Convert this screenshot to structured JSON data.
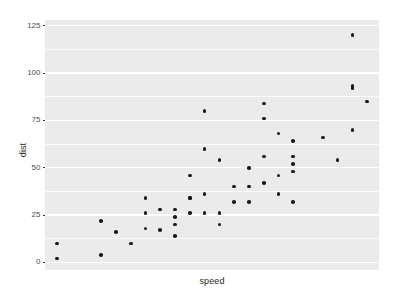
{
  "chart_data": {
    "type": "scatter",
    "title": "",
    "subtitle": "",
    "xlabel": "speed",
    "ylabel": "dist",
    "xlim": [
      3.2,
      25.8
    ],
    "ylim": [
      -4,
      128
    ],
    "xticks": [],
    "xticklabels": [],
    "yticks": [
      0,
      25,
      50,
      75,
      100,
      125
    ],
    "yticklabels": [
      "0",
      "25",
      "50",
      "75",
      "100",
      "125"
    ],
    "y_minor_ticks": [
      12.5,
      37.5,
      62.5,
      87.5,
      112.5
    ],
    "grid": "horizontal-white-on-gray",
    "legend": "none",
    "point_color": "#1a1a1a",
    "panel_background": "#ebebeb",
    "grid_color": "#ffffff",
    "plot_background": "#ffffff",
    "n_points": 50,
    "x": [
      4,
      4,
      7,
      7,
      8,
      9,
      10,
      10,
      10,
      11,
      11,
      12,
      12,
      12,
      12,
      13,
      13,
      13,
      13,
      14,
      14,
      14,
      14,
      15,
      15,
      15,
      16,
      16,
      17,
      17,
      17,
      18,
      18,
      18,
      18,
      19,
      19,
      19,
      20,
      20,
      20,
      20,
      20,
      22,
      23,
      24,
      24,
      24,
      24,
      25
    ],
    "y": [
      2,
      10,
      4,
      22,
      16,
      10,
      18,
      26,
      34,
      17,
      28,
      14,
      20,
      24,
      28,
      26,
      34,
      34,
      46,
      26,
      36,
      60,
      80,
      20,
      26,
      54,
      32,
      40,
      32,
      40,
      50,
      42,
      56,
      76,
      84,
      36,
      46,
      68,
      32,
      48,
      52,
      56,
      64,
      66,
      54,
      70,
      92,
      93,
      120,
      85
    ],
    "points": [
      {
        "x": 4,
        "y": 2
      },
      {
        "x": 4,
        "y": 10
      },
      {
        "x": 7,
        "y": 4
      },
      {
        "x": 7,
        "y": 22
      },
      {
        "x": 8,
        "y": 16
      },
      {
        "x": 9,
        "y": 10
      },
      {
        "x": 10,
        "y": 18
      },
      {
        "x": 10,
        "y": 26
      },
      {
        "x": 10,
        "y": 34
      },
      {
        "x": 11,
        "y": 17
      },
      {
        "x": 11,
        "y": 28
      },
      {
        "x": 12,
        "y": 14
      },
      {
        "x": 12,
        "y": 20
      },
      {
        "x": 12,
        "y": 24
      },
      {
        "x": 12,
        "y": 28
      },
      {
        "x": 13,
        "y": 26
      },
      {
        "x": 13,
        "y": 34
      },
      {
        "x": 13,
        "y": 34
      },
      {
        "x": 13,
        "y": 46
      },
      {
        "x": 14,
        "y": 26
      },
      {
        "x": 14,
        "y": 36
      },
      {
        "x": 14,
        "y": 60
      },
      {
        "x": 14,
        "y": 80
      },
      {
        "x": 15,
        "y": 20
      },
      {
        "x": 15,
        "y": 26
      },
      {
        "x": 15,
        "y": 54
      },
      {
        "x": 16,
        "y": 32
      },
      {
        "x": 16,
        "y": 40
      },
      {
        "x": 17,
        "y": 32
      },
      {
        "x": 17,
        "y": 40
      },
      {
        "x": 17,
        "y": 50
      },
      {
        "x": 18,
        "y": 42
      },
      {
        "x": 18,
        "y": 56
      },
      {
        "x": 18,
        "y": 76
      },
      {
        "x": 18,
        "y": 84
      },
      {
        "x": 19,
        "y": 36
      },
      {
        "x": 19,
        "y": 46
      },
      {
        "x": 19,
        "y": 68
      },
      {
        "x": 20,
        "y": 32
      },
      {
        "x": 20,
        "y": 48
      },
      {
        "x": 20,
        "y": 52
      },
      {
        "x": 20,
        "y": 56
      },
      {
        "x": 20,
        "y": 64
      },
      {
        "x": 22,
        "y": 66
      },
      {
        "x": 23,
        "y": 54
      },
      {
        "x": 24,
        "y": 70
      },
      {
        "x": 24,
        "y": 92
      },
      {
        "x": 24,
        "y": 93
      },
      {
        "x": 24,
        "y": 120
      },
      {
        "x": 25,
        "y": 85
      }
    ]
  }
}
